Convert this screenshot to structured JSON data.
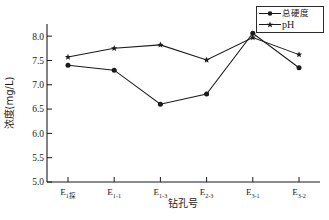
{
  "chart_data": {
    "type": "line",
    "title": "",
    "xlabel": "钻孔号",
    "ylabel": "浓度(mg/L)",
    "categories": [
      "E1探",
      "E1-1",
      "E1-3",
      "E2-3",
      "E3-1",
      "E3-2"
    ],
    "ylim": [
      5.0,
      8.25
    ],
    "yticks": [
      5.0,
      5.5,
      6.0,
      6.5,
      7.0,
      7.5,
      8.0
    ],
    "ytick_labels": [
      "5.0",
      "5.5",
      "6.0",
      "6.5",
      "7.0",
      "7.5",
      "8.0"
    ],
    "grid": false,
    "legend_position": "top-right",
    "series": [
      {
        "name": "总硬度",
        "marker": "circle",
        "color": "#1a1a1a",
        "values": [
          7.4,
          7.3,
          6.6,
          6.81,
          8.06,
          7.35
        ]
      },
      {
        "name": "pH",
        "marker": "star",
        "color": "#1a1a1a",
        "values": [
          7.57,
          7.75,
          7.82,
          7.51,
          7.97,
          7.62
        ]
      }
    ]
  },
  "xtick_parts": [
    {
      "base": "E",
      "sub": "1",
      "cjk": "探"
    },
    {
      "base": "E",
      "sub": "1-1",
      "cjk": ""
    },
    {
      "base": "E",
      "sub": "1-3",
      "cjk": ""
    },
    {
      "base": "E",
      "sub": "2-3",
      "cjk": ""
    },
    {
      "base": "E",
      "sub": "3-1",
      "cjk": ""
    },
    {
      "base": "E",
      "sub": "3-2",
      "cjk": ""
    }
  ],
  "axis": {
    "line_color": "#1a1a1a",
    "y_title": "浓度(mg/L)",
    "x_title": "钻孔号"
  },
  "legend": {
    "items": [
      {
        "label": "总硬度",
        "marker": "circle"
      },
      {
        "label": "pH",
        "marker": "star"
      }
    ]
  }
}
